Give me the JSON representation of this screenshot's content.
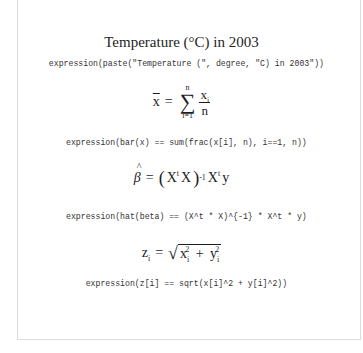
{
  "title": {
    "text": "Temperature (°C) in 2003",
    "code": "expression(paste(\"Temperature (\", degree, \"C) in 2003\"))"
  },
  "formulas": [
    {
      "name": "sample-mean",
      "lhs": "x",
      "equals": "=",
      "sum_upper": "n",
      "sum_lower": "i=1",
      "sum_symbol": "∑",
      "numerator": "x",
      "numerator_sub": "i",
      "denominator": "n",
      "code": "expression(bar(x) == sum(frac(x[i], n), i==1, n))"
    },
    {
      "name": "ols-estimator",
      "lhs": "β",
      "equals": "=",
      "open_paren": "(",
      "term1": "X",
      "term1_sup": "t",
      "term2": "X",
      "close_paren": ")",
      "inv_sup": "-1",
      "term3": "X",
      "term3_sup": "t",
      "term4": "y",
      "code": "expression(hat(beta) == (X^t * X)^{-1} * X^t * y)"
    },
    {
      "name": "euclidean-norm",
      "lhs": "z",
      "lhs_sub": "i",
      "equals": "=",
      "radical": "√",
      "x": "x",
      "x_sub": "i",
      "x_sup": "2",
      "plus": "+",
      "y": "y",
      "y_sub": "i",
      "y_sup": "2",
      "code": "expression(z[i] == sqrt(x[i]^2 + y[i]^2))"
    }
  ]
}
